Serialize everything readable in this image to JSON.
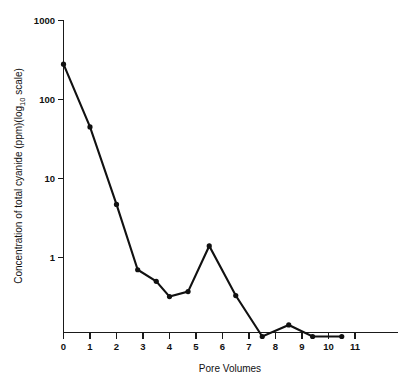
{
  "chart_data": {
    "type": "line",
    "title": "",
    "subtitle": "",
    "xlabel": "Pore Volumes",
    "ylabel": "Concentration of total cyanide (ppm)(log",
    "ylabel_sub": "10",
    "ylabel_tail": " scale)",
    "yscale": "log10",
    "xscale": "linear",
    "xlim": [
      0,
      11
    ],
    "ylim": [
      0.1,
      1000
    ],
    "grid": false,
    "legend": false,
    "legend_position": "none",
    "marker": "filled-circle",
    "line_color": "#111111",
    "marker_color": "#111111",
    "axis_color": "#1a1a1a",
    "background_color": "#ffffff",
    "x_ticks": [
      0,
      1,
      2,
      3,
      4,
      5,
      6,
      7,
      8,
      9,
      10,
      11
    ],
    "x_tick_labels": [
      "0",
      "1",
      "2",
      "3",
      "4",
      "5",
      "6",
      "7",
      "8",
      "9",
      "10",
      "11"
    ],
    "y_ticks": [
      1,
      10,
      100,
      1000
    ],
    "y_tick_labels": [
      "1",
      "10",
      "100",
      "1000"
    ],
    "series": [
      {
        "name": "Total cyanide",
        "x": [
          0,
          1,
          2,
          2.8,
          3.5,
          4.0,
          4.7,
          5.5,
          6.5,
          7.5,
          8.5,
          9.4,
          10.5
        ],
        "y": [
          280,
          45,
          4.7,
          0.7,
          0.5,
          0.32,
          0.37,
          1.4,
          0.33,
          0.1,
          0.14,
          0.1,
          0.1
        ]
      }
    ]
  },
  "axes": {
    "x_title": "Pore Volumes",
    "y_title_part1": "Concentration of total cyanide (ppm)(log",
    "y_title_sub": "10",
    "y_title_part2": " scale)"
  }
}
